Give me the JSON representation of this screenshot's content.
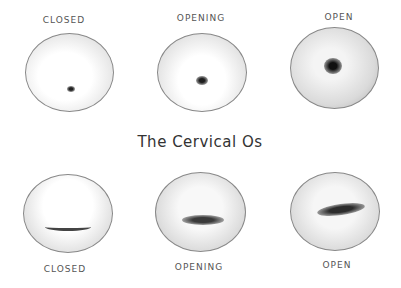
{
  "title": "The Cervical Os",
  "top_row": {
    "caption": "Os (opening) shape",
    "items": [
      {
        "label": "CLOSED"
      },
      {
        "label": "OPENING"
      },
      {
        "label": "OPEN"
      }
    ]
  },
  "bottom_row": {
    "caption": "Slit-shaped os",
    "items": [
      {
        "label": "CLOSED"
      },
      {
        "label": "OPENING"
      },
      {
        "label": "OPEN"
      }
    ]
  }
}
